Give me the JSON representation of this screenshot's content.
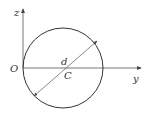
{
  "diagram": {
    "type": "geometry",
    "labels": {
      "z_axis": "z",
      "y_axis": "y",
      "origin": "O",
      "diameter": "d",
      "centroid": "C"
    },
    "colors": {
      "stroke": "#333333",
      "axis": "#555555",
      "background": "#ffffff"
    }
  }
}
